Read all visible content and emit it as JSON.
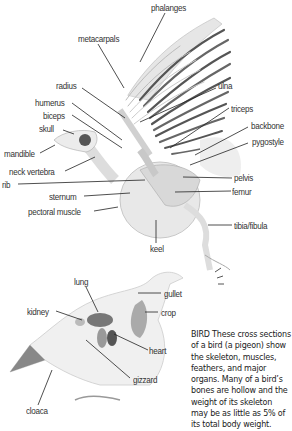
{
  "skeleton_labels": {
    "phalanges": "phalanges",
    "metacarpals": "metacarpals",
    "radius": "radius",
    "ulna": "ulna",
    "humerus": "humerus",
    "biceps": "biceps",
    "triceps": "triceps",
    "skull": "skull",
    "backbone": "backbone",
    "pygostyle": "pygostyle",
    "mandible": "mandible",
    "neck_vertebra": "neck vertebra",
    "pelvis": "pelvis",
    "rib": "rib",
    "femur": "femur",
    "sternum": "sternum",
    "pectoral_muscle": "pectoral muscle",
    "tibia_fibula": "tibia/fibula",
    "keel": "keel"
  },
  "organ_labels": {
    "lung": "lung",
    "gullet": "gullet",
    "kidney": "kidney",
    "crop": "crop",
    "heart": "heart",
    "gizzard": "gizzard",
    "cloaca": "cloaca"
  },
  "caption": "BIRD These cross sections of a bird (a pigeon) show the skeleton, muscles, feathers, and major organs. Many of a bird’s bones are hollow and the weight of its skeleton may be as little as 5% of its total body weight."
}
